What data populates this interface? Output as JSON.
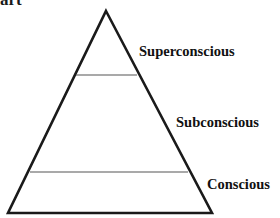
{
  "figure": {
    "type": "pyramid-diagram",
    "background_color": "#ffffff",
    "title_fragment": "art",
    "outline_color": "#1a1a1a",
    "divider_color": "#555555",
    "label_color": "#111111"
  },
  "pyramid": {
    "apex": {
      "x": 106,
      "y": 11
    },
    "bottom_left": {
      "x": 8,
      "y": 213
    },
    "bottom_right": {
      "x": 212,
      "y": 213
    },
    "outline_width": 2.6,
    "dividers": [
      {
        "name": "superconscious-divider",
        "y": 75,
        "x1": 76,
        "x2": 137,
        "width": 1.2
      },
      {
        "name": "subconscious-divider",
        "y": 172,
        "x1": 30,
        "x2": 188,
        "width": 1.2
      }
    ]
  },
  "levels": [
    {
      "id": "superconscious",
      "label": "Superconscious",
      "order": 1,
      "position": "top"
    },
    {
      "id": "subconscious",
      "label": "Subconscious",
      "order": 2,
      "position": "middle"
    },
    {
      "id": "conscious",
      "label": "Conscious",
      "order": 3,
      "position": "bottom"
    }
  ],
  "chart_data": {
    "type": "pie",
    "title": "art",
    "categories": [
      "Superconscious",
      "Subconscious",
      "Conscious"
    ],
    "values": [
      1,
      1,
      1
    ],
    "xlabel": "",
    "ylabel": ""
  }
}
